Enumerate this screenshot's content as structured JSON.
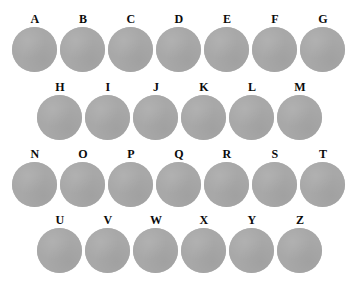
{
  "figure": {
    "name": "sample-plate-grid",
    "background_color": "#ffffff",
    "disc_color": "#a8a8a8",
    "label_color": "#0b0b0b",
    "disc_diameter_px": 45,
    "column_pitch_px": 48,
    "row_pitch_px": 68
  },
  "chart_data": {
    "type": "table",
    "title": "",
    "xlabel": "",
    "ylabel": "",
    "rows": [
      {
        "row_index": 1,
        "left_offset_px": 11,
        "top_px": 11,
        "count": 7,
        "labels": [
          "A",
          "B",
          "C",
          "D",
          "E",
          "F",
          "G"
        ]
      },
      {
        "row_index": 2,
        "left_offset_px": 36,
        "top_px": 79,
        "count": 6,
        "labels": [
          "H",
          "I",
          "J",
          "K",
          "L",
          "M"
        ]
      },
      {
        "row_index": 3,
        "left_offset_px": 11,
        "top_px": 146,
        "count": 7,
        "labels": [
          "N",
          "O",
          "P",
          "Q",
          "R",
          "S",
          "T"
        ]
      },
      {
        "row_index": 4,
        "left_offset_px": 36,
        "top_px": 212,
        "count": 6,
        "labels": [
          "U",
          "V",
          "W",
          "X",
          "Y",
          "Z"
        ]
      }
    ],
    "total_items": 26,
    "all_labels": [
      "A",
      "B",
      "C",
      "D",
      "E",
      "F",
      "G",
      "H",
      "I",
      "J",
      "K",
      "L",
      "M",
      "N",
      "O",
      "P",
      "Q",
      "R",
      "S",
      "T",
      "U",
      "V",
      "W",
      "X",
      "Y",
      "Z"
    ]
  }
}
